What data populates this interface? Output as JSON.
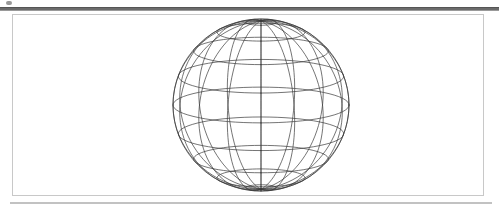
{
  "window": {
    "toolbar_strip_label": "",
    "toolbar_icon": "menu-dot-icon"
  },
  "viewport": {
    "background_color": "#ffffff",
    "border_color": "#c8c8c8",
    "panel_label": ""
  },
  "chart_data": {
    "type": "scatter",
    "title": "",
    "subtitle": "",
    "xlabel": "",
    "ylabel": "",
    "render_mode": "wireframe-sphere",
    "shape": "sphere",
    "line_color": "#3a3a3a",
    "line_width": 0.7,
    "fill": "none",
    "grid": true,
    "legend": false,
    "center_x": 248,
    "center_y": 90,
    "radius_x": 88,
    "radius_y": 86,
    "meridian_count": 16,
    "parallel_count": 9,
    "camera_tilt_deg": 12,
    "north_pole_visible": true,
    "south_pole_visible": false,
    "meridian_longitudes_deg": [
      0,
      22.5,
      45,
      67.5,
      90,
      112.5,
      135,
      157.5,
      180,
      202.5,
      225,
      247.5,
      270,
      292.5,
      315,
      337.5
    ],
    "parallel_latitudes_deg": [
      80,
      60,
      40,
      20,
      0,
      -20,
      -40,
      -60,
      -80
    ],
    "x": [],
    "y": [],
    "values": [],
    "categories": []
  },
  "bottom_bar": {
    "color": "#c2c2c2"
  }
}
